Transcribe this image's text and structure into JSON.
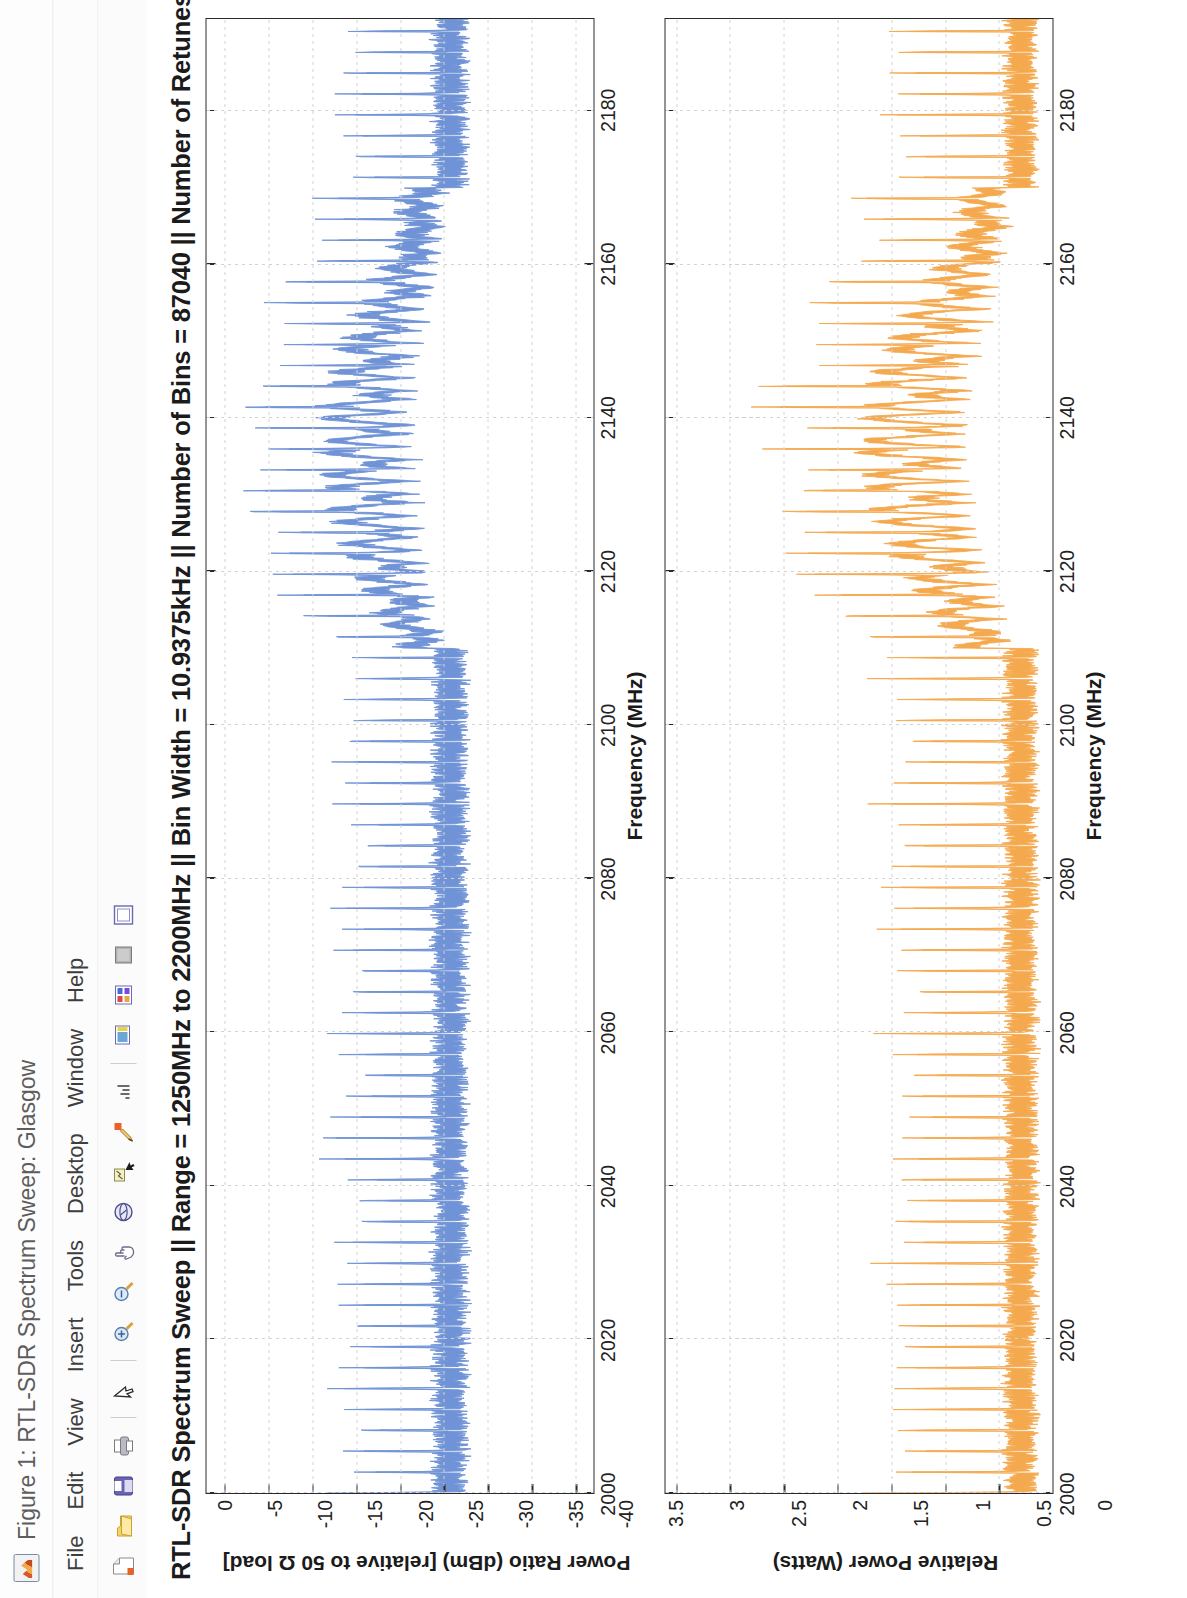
{
  "window": {
    "title": "Figure 1: RTL-SDR Spectrum Sweep: Glasgow",
    "app_icon": "matlab-figure-icon"
  },
  "menubar": {
    "items": [
      {
        "label": "File"
      },
      {
        "label": "Edit"
      },
      {
        "label": "View"
      },
      {
        "label": "Insert"
      },
      {
        "label": "Tools"
      },
      {
        "label": "Desktop"
      },
      {
        "label": "Window"
      },
      {
        "label": "Help"
      }
    ]
  },
  "toolbar": {
    "buttons": [
      {
        "name": "new-figure-icon"
      },
      {
        "name": "open-file-icon"
      },
      {
        "name": "save-figure-icon"
      },
      {
        "name": "print-figure-icon"
      },
      {
        "name": "edit-plot-icon"
      },
      {
        "name": "zoom-in-icon"
      },
      {
        "name": "zoom-out-icon"
      },
      {
        "name": "pan-icon"
      },
      {
        "name": "rotate-3d-icon"
      },
      {
        "name": "data-cursor-icon"
      },
      {
        "name": "brush-icon"
      },
      {
        "name": "link-plot-icon"
      },
      {
        "name": "insert-colorbar-icon"
      },
      {
        "name": "insert-legend-icon"
      },
      {
        "name": "plot-browser-icon"
      },
      {
        "name": "figure-palette-icon"
      }
    ]
  },
  "annotations": [
    {
      "id": "umts",
      "label": "UMTS",
      "arrow_color": "#b259b0"
    },
    {
      "id": "dc-tones",
      "label": "DC Tones",
      "arrow_color": "#b259b0"
    }
  ],
  "chart_data": {
    "type": "line",
    "title": "RTL-SDR Spectrum Sweep  ||  Range = 1250MHz to 2200MHz  ||  Bin Width = 10.9375kHz  ||  Number of Bins = 87040  ||  Number of Retunes = 6",
    "xlabel": "Frequency (MHz)",
    "x_ticks": [
      2000,
      2020,
      2040,
      2060,
      2080,
      2100,
      2120,
      2140,
      2160,
      2180
    ],
    "xlim": [
      2000,
      2192
    ],
    "grid": true,
    "legend": "none",
    "subplots": [
      {
        "name": "power-ratio-dbm",
        "ylabel": "Power Ratio (dBm)  [relative to 50 Ω load]",
        "y_ticks": [
          0,
          -5,
          -10,
          -15,
          -20,
          -25,
          -30,
          -35,
          -40
        ],
        "ylim": [
          -42,
          2
        ],
        "series_name": "Power Ratio",
        "color": "#6f93d6",
        "noise_floor_dbm": -25,
        "dc_tone_peak_dbm": -11,
        "umts_band_mhz": [
          2110,
          2170
        ],
        "umts_peak_dbm": -13
      },
      {
        "name": "relative-power-watts",
        "ylabel": "Relative Power (Watts)",
        "y_ticks": [
          0,
          0.5,
          1,
          1.5,
          2,
          2.5,
          3,
          3.5
        ],
        "ylim": [
          0,
          3.6
        ],
        "series_name": "Relative Power",
        "color": "#f5a94f",
        "noise_floor_watts": 0.35,
        "dc_tone_peak_watts": 1.75,
        "umts_band_mhz": [
          2110,
          2170
        ],
        "umts_peak_watts": 1.6
      }
    ]
  }
}
